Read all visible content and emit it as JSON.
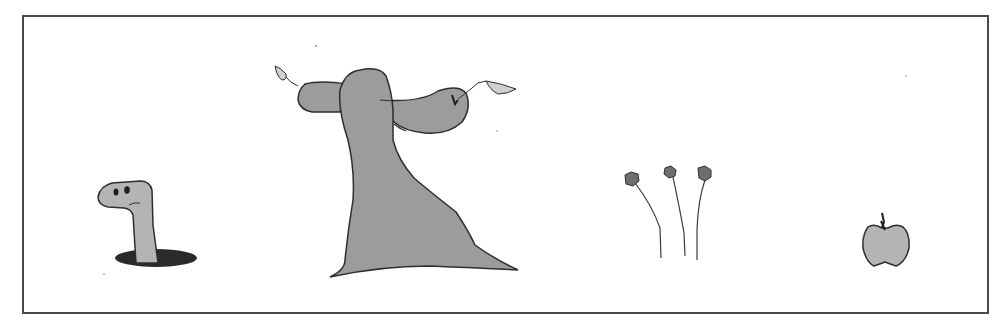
{
  "illustration": {
    "description": "Line drawing of a worm in a hole, a tree with two sprouting branches, three flower stems, and an apple",
    "colors": {
      "fill": "#9c9c9c",
      "light_fill": "#b4b4b4",
      "outline": "#2e2e2e",
      "hole": "#2a2a2a",
      "leaf": "#d0d0d0",
      "frame": "#4a4a4a",
      "background": "#ffffff"
    },
    "objects": [
      {
        "id": "worm",
        "label": "Worm"
      },
      {
        "id": "tree",
        "label": "Tree"
      },
      {
        "id": "flowers",
        "label": "Flowers",
        "count": 3
      },
      {
        "id": "apple",
        "label": "Apple"
      }
    ]
  }
}
